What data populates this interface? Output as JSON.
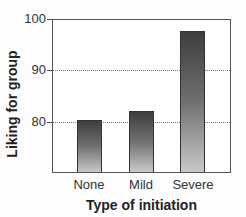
{
  "chart_data": {
    "type": "bar",
    "title": "",
    "categories": [
      "None",
      "Mild",
      "Severe"
    ],
    "values": [
      80.2,
      82.0,
      97.8
    ],
    "xlabel": "Type of initiation",
    "ylabel": "Liking for group",
    "ylim": [
      70,
      100
    ],
    "yticks": [
      80,
      90,
      100
    ],
    "ytick_labels": [
      "80",
      "90",
      "100"
    ],
    "grid": "dotted horizontal at 80 and 90",
    "legend": null,
    "bar_fill": "vertical gradient dark gray (#3e3e3e) to light gray (#c9c9c9)"
  },
  "colors": {
    "bar_top": "#3e3e3e",
    "bar_bottom": "#c9c9c9",
    "axis": "#555555",
    "gridline": "#777777",
    "background": "#ffffff"
  }
}
